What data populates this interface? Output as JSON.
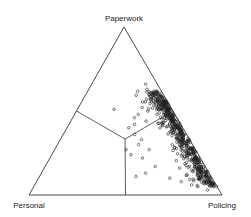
{
  "chart_data": {
    "type": "scatter",
    "subtype": "ternary",
    "title": "",
    "vertices": {
      "top": "Paperwork",
      "bottom_left": "Personal",
      "bottom_right": "Policing"
    },
    "legend": null,
    "grid": false,
    "marker": "open-circle",
    "regions": {
      "description": "Three regions separated by lines meeting at centroid; each region dominated by the nearest vertex component",
      "center": {
        "Paperwork": 0.333,
        "Personal": 0.333,
        "Policing": 0.334
      }
    },
    "dividers": [
      {
        "from": {
          "Paperwork": 0.333,
          "Personal": 0.333,
          "Policing": 0.334
        },
        "to": {
          "Paperwork": 0.5,
          "Personal": 0.5,
          "Policing": 0.0
        }
      },
      {
        "from": {
          "Paperwork": 0.333,
          "Personal": 0.333,
          "Policing": 0.334
        },
        "to": {
          "Paperwork": 0.0,
          "Personal": 0.5,
          "Policing": 0.5
        }
      },
      {
        "from": {
          "Paperwork": 0.333,
          "Personal": 0.333,
          "Policing": 0.334
        },
        "to": {
          "Paperwork": 0.5,
          "Personal": 0.0,
          "Policing": 0.5
        }
      }
    ],
    "points_description": "Approx. 600 officers' time allocations; dense cluster along Paperwork–Policing edge with Personal mostly 0–0.15, Paperwork 0.1–0.65, Policing 0.35–0.9",
    "points": [
      {
        "Paperwork": 0.51,
        "Personal": 0.3,
        "Policing": 0.19
      },
      {
        "Paperwork": 0.27,
        "Personal": 0.36,
        "Policing": 0.37
      },
      {
        "Paperwork": 0.24,
        "Personal": 0.35,
        "Policing": 0.41
      },
      {
        "Paperwork": 0.11,
        "Personal": 0.39,
        "Policing": 0.5
      },
      {
        "Paperwork": 0.66,
        "Personal": 0.06,
        "Policing": 0.28
      },
      {
        "Paperwork": 0.63,
        "Personal": 0.07,
        "Policing": 0.3
      },
      {
        "Paperwork": 0.6,
        "Personal": 0.03,
        "Policing": 0.37
      },
      {
        "Paperwork": 0.57,
        "Personal": 0.1,
        "Policing": 0.33
      },
      {
        "Paperwork": 0.55,
        "Personal": 0.07,
        "Policing": 0.38
      },
      {
        "Paperwork": 0.52,
        "Personal": 0.15,
        "Policing": 0.33
      },
      {
        "Paperwork": 0.5,
        "Personal": 0.13,
        "Policing": 0.37
      },
      {
        "Paperwork": 0.48,
        "Personal": 0.19,
        "Policing": 0.33
      },
      {
        "Paperwork": 0.46,
        "Personal": 0.22,
        "Policing": 0.32
      },
      {
        "Paperwork": 0.44,
        "Personal": 0.17,
        "Policing": 0.39
      },
      {
        "Paperwork": 0.42,
        "Personal": 0.24,
        "Policing": 0.34
      },
      {
        "Paperwork": 0.4,
        "Personal": 0.28,
        "Policing": 0.32
      },
      {
        "Paperwork": 0.36,
        "Personal": 0.27,
        "Policing": 0.37
      },
      {
        "Paperwork": 0.33,
        "Personal": 0.25,
        "Policing": 0.42
      },
      {
        "Paperwork": 0.3,
        "Personal": 0.28,
        "Policing": 0.42
      },
      {
        "Paperwork": 0.27,
        "Personal": 0.24,
        "Policing": 0.49
      },
      {
        "Paperwork": 0.22,
        "Personal": 0.3,
        "Policing": 0.48
      },
      {
        "Paperwork": 0.17,
        "Personal": 0.26,
        "Policing": 0.57
      },
      {
        "Paperwork": 0.13,
        "Personal": 0.33,
        "Policing": 0.54
      },
      {
        "Paperwork": 0.1,
        "Personal": 0.22,
        "Policing": 0.68
      },
      {
        "Paperwork": 0.08,
        "Personal": 0.17,
        "Policing": 0.75
      },
      {
        "Paperwork": 0.12,
        "Personal": 0.12,
        "Policing": 0.76
      },
      {
        "Paperwork": 0.05,
        "Personal": 0.1,
        "Policing": 0.85
      },
      {
        "Paperwork": 0.03,
        "Personal": 0.06,
        "Policing": 0.91
      },
      {
        "Paperwork": 0.08,
        "Personal": 0.03,
        "Policing": 0.89
      }
    ],
    "cluster_generator": {
      "count": 560,
      "seed": 7,
      "Paperwork_range": [
        0.05,
        0.62
      ],
      "Personal_mode": 0.02,
      "Personal_spread": 0.12
    }
  }
}
